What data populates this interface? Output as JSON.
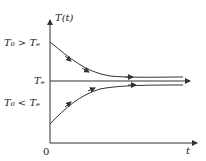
{
  "diagram": {
    "y_axis_label": "T(t)",
    "x_axis_label": "t",
    "origin_label": "0",
    "labels": {
      "upper_start": "T₀ > Tₑ",
      "equilibrium": "Tₑ",
      "lower_start": "T₀ < Tₑ"
    },
    "colors": {
      "stroke": "#333333",
      "background": "#ffffff"
    }
  }
}
